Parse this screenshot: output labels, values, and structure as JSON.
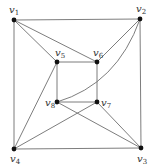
{
  "diagram": {
    "type": "graph",
    "vertices": [
      {
        "id": "v1",
        "name": "v",
        "sub": "1",
        "x": 14,
        "y": 20,
        "lx": 9,
        "ly": 13
      },
      {
        "id": "v2",
        "name": "v",
        "sub": "2",
        "x": 140,
        "y": 19,
        "lx": 136,
        "ly": 12
      },
      {
        "id": "v3",
        "name": "v",
        "sub": "3",
        "x": 141,
        "y": 148,
        "lx": 137,
        "ly": 162
      },
      {
        "id": "v4",
        "name": "v",
        "sub": "4",
        "x": 14,
        "y": 149,
        "lx": 10,
        "ly": 162
      },
      {
        "id": "v5",
        "name": "v",
        "sub": "5",
        "x": 57,
        "y": 62,
        "lx": 55,
        "ly": 56
      },
      {
        "id": "v6",
        "name": "v",
        "sub": "6",
        "x": 97,
        "y": 62,
        "lx": 93,
        "ly": 56
      },
      {
        "id": "v7",
        "name": "v",
        "sub": "7",
        "x": 97,
        "y": 102,
        "lx": 101,
        "ly": 106
      },
      {
        "id": "v8",
        "name": "v",
        "sub": "8",
        "x": 57,
        "y": 102,
        "lx": 45,
        "ly": 106
      }
    ],
    "edges": [
      {
        "from": "v1",
        "to": "v2"
      },
      {
        "from": "v2",
        "to": "v3"
      },
      {
        "from": "v3",
        "to": "v4"
      },
      {
        "from": "v4",
        "to": "v1"
      },
      {
        "from": "v5",
        "to": "v6"
      },
      {
        "from": "v6",
        "to": "v7"
      },
      {
        "from": "v7",
        "to": "v8"
      },
      {
        "from": "v8",
        "to": "v5"
      },
      {
        "from": "v1",
        "to": "v5"
      },
      {
        "from": "v1",
        "to": "v6"
      },
      {
        "from": "v2",
        "to": "v6"
      },
      {
        "from": "v2",
        "to": "v8",
        "curved": true
      },
      {
        "from": "v3",
        "to": "v7"
      },
      {
        "from": "v3",
        "to": "v8"
      },
      {
        "from": "v4",
        "to": "v5"
      },
      {
        "from": "v4",
        "to": "v7"
      }
    ]
  }
}
